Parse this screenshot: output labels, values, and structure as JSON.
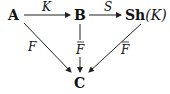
{
  "diagram": {
    "type": "commutative-diagram",
    "nodes": {
      "A": {
        "label": "A"
      },
      "B": {
        "label": "B"
      },
      "ShK": {
        "label_bold": "Sh",
        "label_rest": "(K)"
      },
      "C": {
        "label": "C"
      }
    },
    "edges": [
      {
        "from": "A",
        "to": "B",
        "label": "K"
      },
      {
        "from": "B",
        "to": "ShK",
        "label": "S"
      },
      {
        "from": "A",
        "to": "C",
        "label": "F"
      },
      {
        "from": "B",
        "to": "C",
        "label": "F",
        "overbar": true
      },
      {
        "from": "ShK",
        "to": "C",
        "label": "F",
        "overbar": true
      }
    ]
  }
}
